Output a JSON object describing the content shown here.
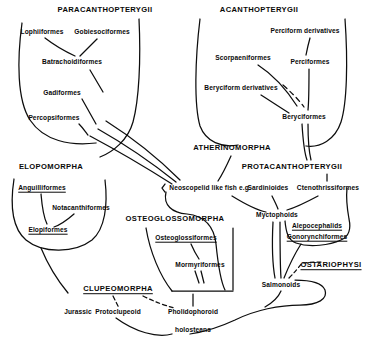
{
  "diagram": {
    "type": "phylogenetic-tree-diagram",
    "background_color": "#ffffff",
    "line_color": "#0d0d0d",
    "text_color": "#0a0a0a"
  },
  "clades": [
    {
      "id": "paracanthopterygii",
      "label": "PARACANTHOPTERYGII",
      "x": 105,
      "y": 10,
      "underlined": false
    },
    {
      "id": "acanthopterygii",
      "label": "ACANTHOPTERYGII",
      "x": 259,
      "y": 10,
      "underlined": false
    },
    {
      "id": "elopomorpha",
      "label": "ELOPOMORPHA",
      "x": 51,
      "y": 167,
      "underlined": false
    },
    {
      "id": "atherinomorpha",
      "label": "ATHERINOMORPHA",
      "x": 232,
      "y": 148,
      "underlined": false
    },
    {
      "id": "protacanthopterygii",
      "label": "PROTACANTHOPTERYGII",
      "x": 292,
      "y": 167,
      "underlined": false
    },
    {
      "id": "osteoglossomorpha",
      "label": "OSTEOGLOSSOMORPHA",
      "x": 175,
      "y": 219,
      "underlined": false
    },
    {
      "id": "clupeomorpha",
      "label": "CLUPEOMORPHA",
      "x": 118,
      "y": 289,
      "underlined": true
    },
    {
      "id": "ostariophysi",
      "label": "OSTARIOPHYSI",
      "x": 331,
      "y": 265,
      "underlined": true
    }
  ],
  "taxa": [
    {
      "id": "lophiiformes",
      "label": "Lophiiformes",
      "x": 42,
      "y": 32,
      "underlined": false
    },
    {
      "id": "gobiesociformes",
      "label": "Gobiesociformes",
      "x": 102,
      "y": 32,
      "underlined": false
    },
    {
      "id": "batrachoidiformes",
      "label": "Batrachoidiformes",
      "x": 72,
      "y": 62,
      "underlined": false
    },
    {
      "id": "gadiformes",
      "label": "Gadiformes",
      "x": 62,
      "y": 93,
      "underlined": false
    },
    {
      "id": "percopsiformes",
      "label": "Percopsiformes",
      "x": 54,
      "y": 118,
      "underlined": false
    },
    {
      "id": "perciform-derivatives",
      "label": "Perciform derivatives",
      "x": 305,
      "y": 31,
      "underlined": false
    },
    {
      "id": "scorpaeniformes",
      "label": "Scorpaeniformes",
      "x": 243,
      "y": 58,
      "underlined": false
    },
    {
      "id": "perciformes",
      "label": "Perciformes",
      "x": 310,
      "y": 62,
      "underlined": false
    },
    {
      "id": "beryciform-derivatives",
      "label": "Beryciform derivatives",
      "x": 241,
      "y": 88,
      "underlined": false
    },
    {
      "id": "beryciformes",
      "label": "Beryciformes",
      "x": 304,
      "y": 117,
      "underlined": false
    },
    {
      "id": "anguilliformes",
      "label": "Anguilliformes",
      "x": 42,
      "y": 188,
      "underlined": true
    },
    {
      "id": "notacanthiformes",
      "label": "Notacanthiformes",
      "x": 81,
      "y": 208,
      "underlined": false
    },
    {
      "id": "elopiformes",
      "label": "Elopiformes",
      "x": 48,
      "y": 230,
      "underlined": true
    },
    {
      "id": "neoscopelid",
      "label": "Neoscopelid like fish e.g.",
      "x": 210,
      "y": 188,
      "underlined": false
    },
    {
      "id": "sardinioides",
      "label": "Sardinioides",
      "x": 268,
      "y": 188,
      "underlined": false
    },
    {
      "id": "ctenothrissiformes",
      "label": "Ctenothrissiformes",
      "x": 328,
      "y": 188,
      "underlined": false
    },
    {
      "id": "myctophoids",
      "label": "Myctophoids",
      "x": 277,
      "y": 215,
      "underlined": false
    },
    {
      "id": "alepocephalids",
      "label": "Alepocephalids",
      "x": 317,
      "y": 226,
      "underlined": true
    },
    {
      "id": "gonorynchiformes",
      "label": "Gonorynchiformes",
      "x": 317,
      "y": 237,
      "underlined": true
    },
    {
      "id": "osteoglossiformes",
      "label": "Osteoglossiformes",
      "x": 186,
      "y": 238,
      "underlined": true
    },
    {
      "id": "mormyriformes",
      "label": "Mormyriformes",
      "x": 200,
      "y": 265,
      "underlined": false
    },
    {
      "id": "salmonoids",
      "label": "Salmonoids",
      "x": 281,
      "y": 285,
      "underlined": false
    },
    {
      "id": "jurassic",
      "label": "Jurassic",
      "x": 78,
      "y": 312,
      "underlined": false
    },
    {
      "id": "protoclupeoid",
      "label": "Protoclupeoid",
      "x": 118,
      "y": 312,
      "underlined": false
    },
    {
      "id": "pholidophoroid",
      "label": "Pholidophoroid",
      "x": 193,
      "y": 312,
      "underlined": false
    },
    {
      "id": "holosteans",
      "label": "holosteans",
      "x": 193,
      "y": 330,
      "underlined": false
    }
  ]
}
